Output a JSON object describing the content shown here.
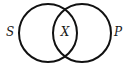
{
  "diagram": {
    "type": "venn",
    "background": "#ffffff",
    "stroke_color": "#111111",
    "sets": [
      {
        "id": "S",
        "label": "S",
        "cx": 48,
        "cy": 33,
        "r": 29
      },
      {
        "id": "P",
        "label": "P",
        "cx": 82,
        "cy": 33,
        "r": 29
      }
    ],
    "intersection": {
      "label": "X",
      "sets": [
        "S",
        "P"
      ]
    },
    "labels": {
      "left": "S",
      "center": "X",
      "right": "P"
    }
  }
}
